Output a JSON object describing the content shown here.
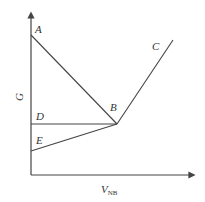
{
  "diagram": {
    "axes": {
      "x_label": "V",
      "x_label_sub": "NB",
      "y_label": "G",
      "color": "#444444"
    },
    "points": {
      "A": {
        "label": "A",
        "x": 31,
        "y": 35
      },
      "B": {
        "label": "B",
        "x": 117,
        "y": 124
      },
      "C": {
        "label": "C",
        "x": 173,
        "y": 40
      },
      "D": {
        "label": "D",
        "x": 31,
        "y": 124
      },
      "E": {
        "label": "E",
        "x": 31,
        "y": 151
      }
    },
    "segments": [
      {
        "from": "A",
        "to": "B"
      },
      {
        "from": "B",
        "to": "C"
      },
      {
        "from": "D",
        "to": "B"
      },
      {
        "from": "E",
        "to": "B"
      }
    ],
    "line_color": "#444444"
  }
}
